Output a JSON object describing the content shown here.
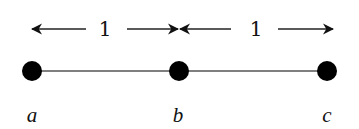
{
  "diagram": {
    "type": "path-graph",
    "nodes": [
      {
        "id": "a",
        "label": "a",
        "x": 32,
        "y": 71
      },
      {
        "id": "b",
        "label": "b",
        "x": 179,
        "y": 71
      },
      {
        "id": "c",
        "label": "c",
        "x": 327,
        "y": 71
      }
    ],
    "edges": [
      {
        "from": "a",
        "to": "b"
      },
      {
        "from": "b",
        "to": "c"
      }
    ],
    "distances": [
      {
        "between": [
          "a",
          "b"
        ],
        "label": "1"
      },
      {
        "between": [
          "b",
          "c"
        ],
        "label": "1"
      }
    ],
    "colors": {
      "node": "#000000",
      "edge": "#555555",
      "arrow": "#222222",
      "background": "#ffffff"
    }
  }
}
